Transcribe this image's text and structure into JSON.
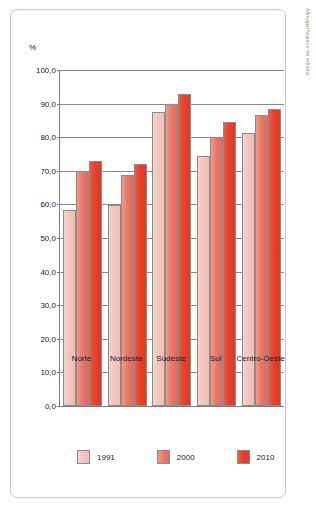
{
  "credit": {
    "text": "Allmaps/Arquivo da editora"
  },
  "legend": {
    "position": "bottom",
    "items": [
      {
        "label": "1991",
        "color": "#f2c6be",
        "key": "y1991"
      },
      {
        "label": "2000",
        "color": "#e8796a",
        "key": "y2000"
      },
      {
        "label": "2010",
        "color": "#e8402a",
        "key": "y2010"
      }
    ]
  },
  "chart_data": {
    "type": "bar",
    "title": "",
    "subtitle": "",
    "xlabel": "",
    "ylabel": "%",
    "ylim": [
      0.0,
      100.0
    ],
    "ytick_step": 10.0,
    "grid": true,
    "legend_position": "bottom",
    "categories": [
      "Norte",
      "Nordeste",
      "Sudeste",
      "Sul",
      "Centro-Oeste"
    ],
    "ytick_labels": [
      "0,0",
      "10,0",
      "20,0",
      "30,0",
      "40,0",
      "50,0",
      "60,0",
      "70,0",
      "80,0",
      "90,0",
      "100,0"
    ],
    "ytick_values": [
      0,
      10,
      20,
      30,
      40,
      50,
      60,
      70,
      80,
      90,
      100
    ],
    "series": [
      {
        "name": "1991",
        "color": "#f2c6be",
        "values": [
          58.4,
          59.9,
          87.6,
          74.3,
          81.2
        ]
      },
      {
        "name": "2000",
        "color": "#e8796a",
        "values": [
          70.0,
          68.8,
          90.0,
          80.0,
          86.5
        ]
      },
      {
        "name": "2010",
        "color": "#e8402a",
        "values": [
          73.0,
          72.1,
          92.8,
          84.5,
          88.4
        ]
      }
    ]
  }
}
